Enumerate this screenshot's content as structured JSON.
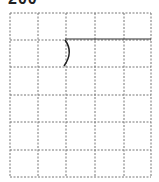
{
  "header": {
    "title": "200"
  },
  "grid": {
    "x_lines": [
      10,
      38,
      66,
      95,
      124,
      151
    ],
    "y_lines": [
      13,
      40,
      67,
      95,
      122,
      150,
      177
    ],
    "dash_color": "#777777"
  },
  "figure": {
    "line": {
      "x1": 65,
      "y1": 39,
      "x2": 151,
      "y2": 39,
      "color": "#333333"
    },
    "curve": {
      "path": "M65 40 Q74 52 64 66",
      "color": "#222222"
    }
  }
}
